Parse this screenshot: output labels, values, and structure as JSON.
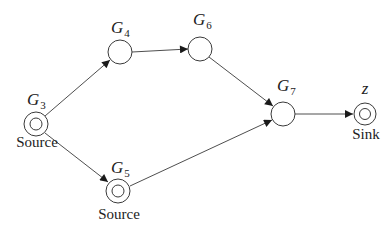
{
  "diagram": {
    "colors": {
      "stroke": "#3a3a3a",
      "text": "#222222",
      "background": "#ffffff"
    },
    "nodes": [
      {
        "id": "G3",
        "label": "G",
        "subscript": "3",
        "role": "Source",
        "type": "double",
        "x": 36,
        "y": 124
      },
      {
        "id": "G4",
        "label": "G",
        "subscript": "4",
        "role": "",
        "type": "single",
        "x": 120,
        "y": 52
      },
      {
        "id": "G6",
        "label": "G",
        "subscript": "6",
        "role": "",
        "type": "single",
        "x": 200,
        "y": 49
      },
      {
        "id": "G7",
        "label": "G",
        "subscript": "7",
        "role": "",
        "type": "single",
        "x": 283,
        "y": 114
      },
      {
        "id": "z",
        "label": "z",
        "subscript": "",
        "role": "Sink",
        "type": "double",
        "x": 365,
        "y": 114
      },
      {
        "id": "G5",
        "label": "G",
        "subscript": "5",
        "role": "Source",
        "type": "double",
        "x": 118,
        "y": 191
      }
    ],
    "edges": [
      {
        "from": "G3",
        "to": "G4"
      },
      {
        "from": "G3",
        "to": "G5"
      },
      {
        "from": "G4",
        "to": "G6"
      },
      {
        "from": "G6",
        "to": "G7"
      },
      {
        "from": "G5",
        "to": "G7"
      },
      {
        "from": "G7",
        "to": "z"
      }
    ]
  }
}
